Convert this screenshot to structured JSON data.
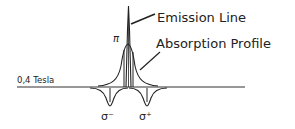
{
  "diagram": {
    "field_label": "0,4 Tesla",
    "emission_label": "Emission Line",
    "absorption_label": "Absorption Profile",
    "pi_label": "π",
    "sigma_minus_label": "σ⁻",
    "sigma_plus_label": "σ⁺",
    "line_color": "#222222",
    "background": "#ffffff"
  }
}
